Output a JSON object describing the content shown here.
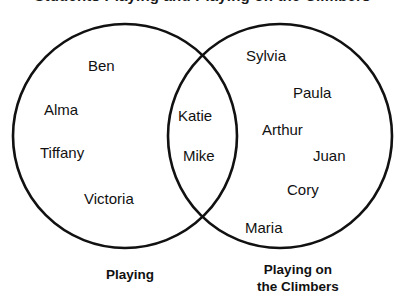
{
  "title": {
    "text": "Students Playing and Playing on the Climbers",
    "clipped": true
  },
  "diagram": {
    "type": "venn",
    "sets": 2,
    "stroke_color": "#111111",
    "fill_color": "#ffffff",
    "left_circle": {
      "cx": 125,
      "cy": 136,
      "r": 112
    },
    "right_circle": {
      "cx": 280,
      "cy": 136,
      "r": 112
    },
    "left_label": "Playing",
    "right_label_line1": "Playing on",
    "right_label_line2": "the Climbers"
  },
  "regions": {
    "left_only": {
      "name": "Playing",
      "members": [
        {
          "label": "Ben",
          "x": 88,
          "y": 58
        },
        {
          "label": "Alma",
          "x": 44,
          "y": 102
        },
        {
          "label": "Tiffany",
          "x": 40,
          "y": 145
        },
        {
          "label": "Victoria",
          "x": 84,
          "y": 191
        }
      ]
    },
    "intersection": {
      "name": "Playing and Playing on the Climbers",
      "members": [
        {
          "label": "Katie",
          "x": 178,
          "y": 108
        },
        {
          "label": "Mike",
          "x": 183,
          "y": 148
        }
      ]
    },
    "right_only": {
      "name": "Playing on the Climbers",
      "members": [
        {
          "label": "Sylvia",
          "x": 246,
          "y": 48
        },
        {
          "label": "Paula",
          "x": 293,
          "y": 85
        },
        {
          "label": "Arthur",
          "x": 262,
          "y": 122
        },
        {
          "label": "Juan",
          "x": 313,
          "y": 148
        },
        {
          "label": "Cory",
          "x": 287,
          "y": 182
        },
        {
          "label": "Maria",
          "x": 245,
          "y": 220
        }
      ]
    }
  },
  "labels": {
    "left": {
      "text": "Playing",
      "x": 75,
      "y": 267,
      "width": 110
    },
    "right": {
      "line1": "Playing on",
      "line2": "the Climbers",
      "x": 228,
      "y": 262,
      "width": 140
    }
  }
}
